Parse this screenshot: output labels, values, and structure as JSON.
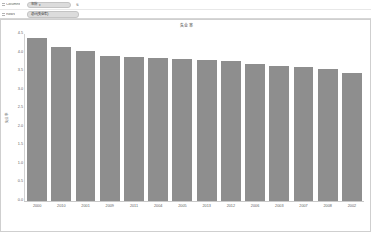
{
  "shelves": {
    "columns_label": "Columns",
    "rows_label": "Rows",
    "columns_pill": "年份",
    "columns_sort_icon": "sort-descending-icon",
    "rows_pill": "总计(失业率)"
  },
  "chart_data": {
    "type": "bar",
    "title": "失业率",
    "xlabel": "",
    "ylabel": "失业率",
    "categories": [
      "2000",
      "2010",
      "2001",
      "2009",
      "2011",
      "2004",
      "2005",
      "2013",
      "2012",
      "2006",
      "2003",
      "2007",
      "2008",
      "2002"
    ],
    "values": [
      4.4,
      4.15,
      4.05,
      3.9,
      3.88,
      3.85,
      3.82,
      3.8,
      3.78,
      3.7,
      3.65,
      3.6,
      3.55,
      3.45
    ],
    "ylim": [
      0.0,
      4.5
    ],
    "ytick_labels": [
      "4.5",
      "4.0",
      "3.5",
      "3.0",
      "2.5",
      "2.0",
      "1.5",
      "1.0",
      "0.5",
      "0.0"
    ],
    "ytick_values": [
      4.5,
      4.0,
      3.5,
      3.0,
      2.5,
      2.0,
      1.5,
      1.0,
      0.5,
      0.0
    ],
    "grid": false,
    "legend": "none",
    "bar_color": "#8e8e8e"
  }
}
